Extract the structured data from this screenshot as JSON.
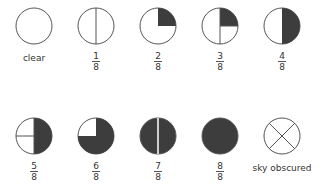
{
  "colors": {
    "fill": "#3d3d3d",
    "stroke": "#555555"
  },
  "symbols": [
    {
      "key": "clear",
      "label": "clear"
    },
    {
      "key": "1/8",
      "num": "1",
      "den": "8"
    },
    {
      "key": "2/8",
      "num": "2",
      "den": "8"
    },
    {
      "key": "3/8",
      "num": "3",
      "den": "8"
    },
    {
      "key": "4/8",
      "num": "4",
      "den": "8"
    },
    {
      "key": "5/8",
      "num": "5",
      "den": "8"
    },
    {
      "key": "6/8",
      "num": "6",
      "den": "8"
    },
    {
      "key": "7/8",
      "num": "7",
      "den": "8"
    },
    {
      "key": "8/8",
      "num": "8",
      "den": "8"
    },
    {
      "key": "sky-obscured",
      "label": "sky obscured"
    }
  ]
}
